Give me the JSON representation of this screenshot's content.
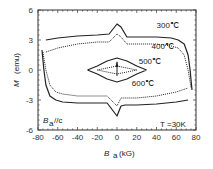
{
  "chart_data": {
    "type": "line",
    "title": "",
    "xlabel": "B_a (kG)",
    "xlabel_main": "B",
    "xlabel_sub": "a",
    "xlabel_unit": "(kG)",
    "ylabel": "M (emu)",
    "ylabel_main": "M",
    "ylabel_unit": "(emu)",
    "xlim": [
      -80,
      80
    ],
    "ylim": [
      -6,
      6
    ],
    "xticks": [
      -80,
      -60,
      -40,
      -20,
      0,
      20,
      40,
      60,
      80
    ],
    "yticks": [
      6,
      3,
      0,
      -3,
      -6
    ],
    "grid": false,
    "legend": "none",
    "annotations": {
      "field_dir": "B  //c",
      "field_dir_main": "B",
      "field_dir_sub": "a",
      "field_dir_rest": "//c",
      "temperature": "T =30K"
    },
    "series": [
      {
        "name": "300℃",
        "style": "solid",
        "upper": {
          "x": [
            -72,
            -60,
            -40,
            -20,
            -8,
            0,
            4,
            10,
            20,
            40,
            55,
            62,
            68,
            72,
            74,
            76
          ],
          "y": [
            3.0,
            3.2,
            3.4,
            3.5,
            3.6,
            4.6,
            4.3,
            3.3,
            3.3,
            3.3,
            3.2,
            3.0,
            2.6,
            1.5,
            0,
            -2.0
          ]
        },
        "lower": {
          "x": [
            -76,
            -74,
            -72,
            -68,
            -62,
            -55,
            -40,
            -20,
            -10,
            0,
            4,
            8,
            20,
            40,
            60,
            72
          ],
          "y": [
            2.0,
            0,
            -1.5,
            -2.6,
            -3.0,
            -3.2,
            -3.3,
            -3.3,
            -3.3,
            -4.6,
            -3.6,
            -3.5,
            -3.5,
            -3.4,
            -3.2,
            -3.0
          ]
        }
      },
      {
        "name": "400℃",
        "style": "dotted",
        "upper": {
          "x": [
            -72,
            -60,
            -40,
            -20,
            -8,
            0,
            4,
            10,
            20,
            40,
            55,
            62,
            68,
            72,
            75
          ],
          "y": [
            1.8,
            2.2,
            2.6,
            2.8,
            2.8,
            3.6,
            3.3,
            2.6,
            2.6,
            2.6,
            2.4,
            2.2,
            1.5,
            0,
            -1.8
          ]
        },
        "lower": {
          "x": [
            -75,
            -72,
            -68,
            -62,
            -55,
            -40,
            -20,
            -10,
            0,
            4,
            8,
            20,
            40,
            60,
            72
          ],
          "y": [
            1.8,
            0,
            -1.5,
            -2.2,
            -2.4,
            -2.6,
            -2.6,
            -2.6,
            -3.6,
            -2.8,
            -2.8,
            -2.8,
            -2.6,
            -2.2,
            -1.8
          ]
        }
      },
      {
        "name": "500℃",
        "style": "solid",
        "upper": {
          "x": [
            -30,
            -20,
            -10,
            0,
            10,
            20,
            30
          ],
          "y": [
            0,
            0.4,
            0.9,
            1.2,
            0.9,
            0.4,
            0
          ]
        },
        "lower": {
          "x": [
            30,
            20,
            10,
            0,
            -10,
            -20,
            -30
          ],
          "y": [
            0,
            -0.4,
            -0.9,
            -1.2,
            -0.9,
            -0.4,
            0
          ]
        }
      },
      {
        "name": "600℃",
        "style": "dotted",
        "upper": {
          "x": [
            -20,
            -10,
            0,
            10,
            20
          ],
          "y": [
            0,
            0.2,
            0.4,
            0.2,
            0
          ]
        },
        "lower": {
          "x": [
            20,
            10,
            0,
            -10,
            -20
          ],
          "y": [
            0,
            -0.2,
            -0.4,
            -0.2,
            0
          ]
        }
      }
    ],
    "labels": [
      {
        "text": "300℃",
        "x": 40,
        "y": 4.2
      },
      {
        "text": "400℃",
        "x": 35,
        "y": 2.1
      },
      {
        "text": "500℃",
        "x": 22,
        "y": 0.6
      },
      {
        "text": "600℃",
        "x": 15,
        "y": -1.6
      }
    ]
  },
  "caption_hint": ""
}
